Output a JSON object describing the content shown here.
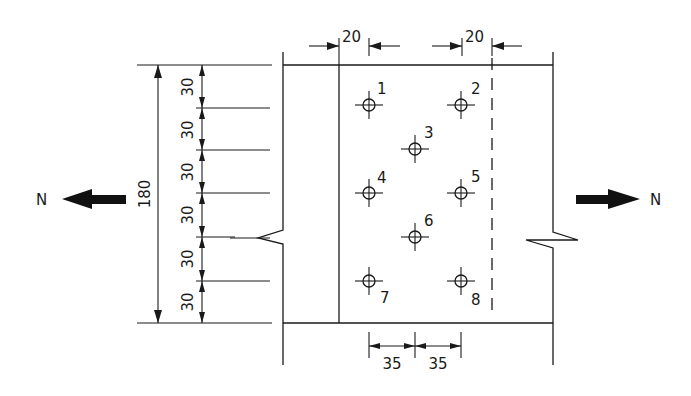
{
  "diagram": {
    "type": "bolted-splice-plate-connection",
    "units": "mm",
    "force_label_left": "N",
    "force_label_right": "N",
    "dimensions": {
      "top_edge_left": "20",
      "top_edge_right": "20",
      "total_height": "180",
      "row_spacings": [
        "30",
        "30",
        "30",
        "30",
        "30",
        "30"
      ],
      "bottom_spacings": [
        "35",
        "35"
      ]
    },
    "bolts": [
      {
        "id": "1",
        "label": "1"
      },
      {
        "id": "2",
        "label": "2"
      },
      {
        "id": "3",
        "label": "3"
      },
      {
        "id": "4",
        "label": "4"
      },
      {
        "id": "5",
        "label": "5"
      },
      {
        "id": "6",
        "label": "6"
      },
      {
        "id": "7",
        "label": "7"
      },
      {
        "id": "8",
        "label": "8"
      }
    ],
    "colors": {
      "line": "#1a1a1a",
      "background": "#ffffff"
    }
  }
}
